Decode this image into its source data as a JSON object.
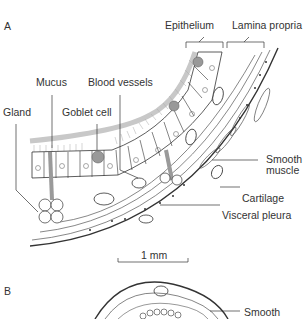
{
  "figure": {
    "panels": [
      {
        "id": "A",
        "labels": {
          "epithelium": "Epithelium",
          "lamina_propria": "Lamina propria",
          "mucus": "Mucus",
          "blood_vessels": "Blood vessels",
          "gland": "Gland",
          "goblet_cell": "Goblet cell",
          "smooth_muscle_1": "Smooth",
          "smooth_muscle_2": "muscle",
          "cartilage": "Cartilage",
          "visceral_pleura": "Visceral pleura"
        },
        "scale_bar": "1 mm"
      },
      {
        "id": "B",
        "labels": {
          "smooth": "Smooth"
        }
      }
    ],
    "colors": {
      "line": "#333333",
      "mucus": "#c8c8c8",
      "gland_duct": "#9a9a9a",
      "goblet": "#777777"
    }
  }
}
